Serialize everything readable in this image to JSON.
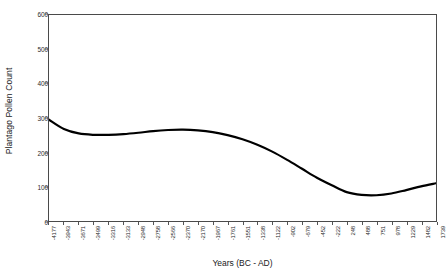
{
  "chart_data": {
    "type": "line",
    "title": "",
    "xlabel": "Years (BC - AD)",
    "ylabel": "Plantago Pollen Count",
    "ylim": [
      0,
      600
    ],
    "yticks": [
      0,
      100,
      200,
      300,
      400,
      500,
      600
    ],
    "ytick_labels": [
      "0",
      "100",
      "200",
      "300",
      "400",
      "500",
      "600"
    ],
    "grid": false,
    "legend": null,
    "series_color": "#000000",
    "frame_color": "#4a4a4a",
    "categories": [
      "-4177",
      "-3943",
      "-3671",
      "-3499",
      "-3316",
      "-3133",
      "-2948",
      "-2758",
      "-2566",
      "-2370",
      "-2170",
      "-1967",
      "-1761",
      "-1551",
      "-1338",
      "-1122",
      "-902",
      "-679",
      "-452",
      "-222",
      "248",
      "488",
      "751",
      "978",
      "1229",
      "1482",
      "1739"
    ],
    "series": [
      {
        "name": "Plantago Pollen Count",
        "values": [
          295,
          268,
          255,
          251,
          251,
          253,
          257,
          262,
          265,
          266,
          264,
          259,
          250,
          238,
          222,
          202,
          178,
          152,
          126,
          104,
          84,
          76,
          75,
          80,
          90,
          101,
          110
        ]
      }
    ]
  }
}
